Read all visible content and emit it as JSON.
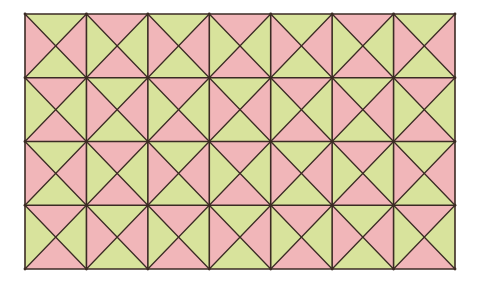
{
  "diagram": {
    "title": "",
    "type": "triangle-square tiling",
    "grid": {
      "cols": 7,
      "rows": 4,
      "x0": 25,
      "y0": 14,
      "x1": 455,
      "y1": 269
    },
    "colors": {
      "pink": "#f1b6b9",
      "green": "#d8e39c",
      "line": "#3b2b24",
      "background": "#ffffff"
    },
    "patterns": {
      "A": {
        "top": "green",
        "right": "pink",
        "bottom": "green",
        "left": "pink"
      },
      "B": {
        "top": "pink",
        "right": "green",
        "bottom": "pink",
        "left": "green"
      }
    },
    "cells": [
      [
        "A",
        "B",
        "A",
        "B",
        "A",
        "B",
        "A"
      ],
      [
        "B",
        "A",
        "B",
        "A",
        "B",
        "A",
        "B"
      ],
      [
        "A",
        "B",
        "A",
        "B",
        "A",
        "B",
        "A"
      ],
      [
        "B",
        "A",
        "B",
        "A",
        "B",
        "A",
        "B"
      ]
    ]
  }
}
